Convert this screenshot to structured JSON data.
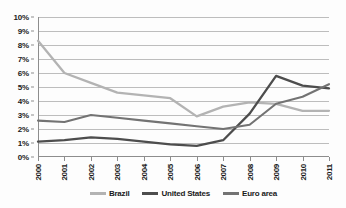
{
  "chart_data": {
    "type": "line",
    "title": "",
    "subtitle": "",
    "xlabel": "",
    "ylabel": "",
    "x": [
      "2000",
      "2001",
      "2002",
      "2003",
      "2004",
      "2005",
      "2006",
      "2007",
      "2008",
      "2009",
      "2010",
      "2011"
    ],
    "categories": [
      "2000",
      "2001",
      "2002",
      "2003",
      "2004",
      "2005",
      "2006",
      "2007",
      "2008",
      "2009",
      "2010",
      "2011"
    ],
    "series": [
      {
        "name": "Brazil",
        "color": "#b3b3b3",
        "values": [
          8.3,
          6.0,
          5.3,
          4.6,
          4.4,
          4.2,
          2.9,
          3.6,
          3.9,
          3.8,
          3.3,
          3.3
        ]
      },
      {
        "name": "United States",
        "color": "#4d4d4d",
        "values": [
          1.1,
          1.2,
          1.4,
          1.3,
          1.1,
          0.9,
          0.8,
          1.2,
          3.1,
          5.8,
          5.1,
          4.9
        ]
      },
      {
        "name": "Euro area",
        "color": "#737373",
        "values": [
          2.6,
          2.5,
          3.0,
          2.8,
          2.6,
          2.4,
          2.2,
          2.0,
          2.3,
          3.8,
          4.3,
          5.2
        ]
      }
    ],
    "ylim": [
      0,
      10
    ],
    "yticks": [
      0,
      1,
      2,
      3,
      4,
      5,
      6,
      7,
      8,
      9,
      10
    ],
    "ytick_labels": [
      "0%",
      "1%",
      "2%",
      "3%",
      "4%",
      "5%",
      "6%",
      "7%",
      "8%",
      "9%",
      "10%"
    ],
    "grid": true,
    "grid_axis": "y",
    "legend_position": "bottom",
    "legend_entries": [
      "Brazil",
      "United States",
      "Euro area"
    ]
  },
  "colors": {
    "brazil": "#b3b3b3",
    "united_states": "#4d4d4d",
    "euro_area": "#737373",
    "gridline": "#bdbdbd",
    "axis": "#8d8d8d",
    "text": "#1a1a1a",
    "background": "#fdfdfd"
  }
}
